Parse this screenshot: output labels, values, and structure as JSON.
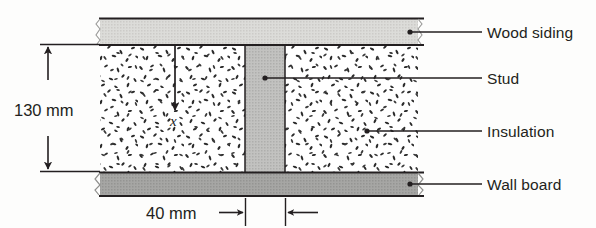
{
  "figure": {
    "type": "wall-cross-section-diagram",
    "background_color": "#fdfdfc",
    "line_color": "#231f20"
  },
  "layers": [
    {
      "key": "wood_siding",
      "label": "Wood siding",
      "fill": "#d9d9d6",
      "x": 100,
      "y": 18,
      "width": 318,
      "height": 27
    },
    {
      "key": "insulation",
      "label": "Insulation",
      "fill": "#ffffff",
      "x": 100,
      "y": 45,
      "width": 318,
      "height": 127
    },
    {
      "key": "stud",
      "label": "Stud",
      "fill": "#bfbfbd",
      "x": 245,
      "y": 45,
      "width": 40,
      "height": 127
    },
    {
      "key": "wall_board",
      "label": "Wall board",
      "fill": "#a2a2a0",
      "x": 100,
      "y": 172,
      "width": 318,
      "height": 24
    }
  ],
  "callouts": [
    {
      "key": "wood-siding",
      "label": "Wood siding",
      "dot_x": 410,
      "dot_y": 32,
      "line_end_x": 482,
      "text_x": 487,
      "text_y": 24
    },
    {
      "key": "stud",
      "label": "Stud",
      "dot_x": 265,
      "dot_y": 78,
      "line_end_x": 482,
      "text_x": 487,
      "text_y": 70
    },
    {
      "key": "insulation",
      "label": "Insulation",
      "dot_x": 367,
      "dot_y": 131,
      "line_end_x": 482,
      "text_x": 487,
      "text_y": 123
    },
    {
      "key": "wall-board",
      "label": "Wall board",
      "dot_x": 410,
      "dot_y": 184,
      "line_end_x": 482,
      "text_x": 487,
      "text_y": 176
    }
  ],
  "dimensions": {
    "vertical": {
      "label": "130 mm",
      "value": 130,
      "unit": "mm",
      "text_x": 14,
      "text_y": 101,
      "arrow_x": 48,
      "top_y": 45,
      "bottom_y": 171,
      "ext_left_x": 40,
      "ext_right_x": 100
    },
    "horizontal": {
      "label": "40 mm",
      "value": 40,
      "unit": "mm",
      "text_x": 146,
      "text_y": 204,
      "left_tick_x": 245,
      "right_tick_x": 285,
      "line_y": 213,
      "ext_top_y": 198,
      "ext_bottom_y": 226,
      "arrow_in_start_x": 219,
      "arrow_out_end_x": 318
    }
  },
  "axis_arrow": {
    "label": "x",
    "x": 175,
    "y_start": 46,
    "y_end": 112,
    "text_x": 170,
    "text_y": 114
  }
}
